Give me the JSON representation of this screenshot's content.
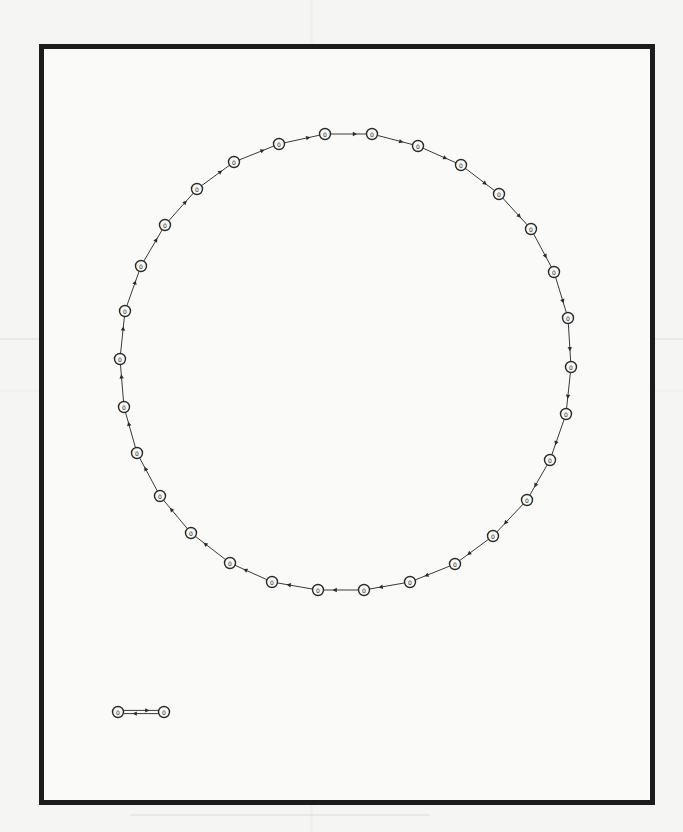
{
  "figure": {
    "type": "directed-graph",
    "frame": {
      "left": 39,
      "top": 44,
      "right": 650,
      "bottom": 800,
      "border_color": "#1c1c1c",
      "border_width": 5
    },
    "colors": {
      "edge": "#3a3a3a",
      "node_stroke": "#2a2a2a",
      "node_fill": "#f8f8f6",
      "background": "#f5f5f3"
    }
  },
  "ring": {
    "center": [
      345,
      362
    ],
    "radius": 227,
    "direction": "clockwise",
    "nodes": [
      {
        "id": "n0",
        "x": 325,
        "y": 134,
        "label": "0"
      },
      {
        "id": "n1",
        "x": 372,
        "y": 134,
        "label": "0"
      },
      {
        "id": "n2",
        "x": 418,
        "y": 146,
        "label": "0"
      },
      {
        "id": "n3",
        "x": 461,
        "y": 165,
        "label": "0"
      },
      {
        "id": "n4",
        "x": 499,
        "y": 194,
        "label": "0"
      },
      {
        "id": "n5",
        "x": 531,
        "y": 229,
        "label": "0"
      },
      {
        "id": "n6",
        "x": 554,
        "y": 272,
        "label": "0"
      },
      {
        "id": "n7",
        "x": 568,
        "y": 318,
        "label": "0"
      },
      {
        "id": "n8",
        "x": 571,
        "y": 367,
        "label": "0"
      },
      {
        "id": "n9",
        "x": 566,
        "y": 414,
        "label": "0"
      },
      {
        "id": "n10",
        "x": 550,
        "y": 460,
        "label": "0"
      },
      {
        "id": "n11",
        "x": 527,
        "y": 500,
        "label": "0"
      },
      {
        "id": "n12",
        "x": 493,
        "y": 536,
        "label": "0"
      },
      {
        "id": "n13",
        "x": 455,
        "y": 564,
        "label": "0"
      },
      {
        "id": "n14",
        "x": 410,
        "y": 582,
        "label": "0"
      },
      {
        "id": "n15",
        "x": 364,
        "y": 590,
        "label": "0"
      },
      {
        "id": "n16",
        "x": 318,
        "y": 590,
        "label": "0"
      },
      {
        "id": "n17",
        "x": 272,
        "y": 582,
        "label": "0"
      },
      {
        "id": "n18",
        "x": 230,
        "y": 563,
        "label": "0"
      },
      {
        "id": "n19",
        "x": 191,
        "y": 533,
        "label": "0"
      },
      {
        "id": "n20",
        "x": 160,
        "y": 496,
        "label": "0"
      },
      {
        "id": "n21",
        "x": 137,
        "y": 453,
        "label": "0"
      },
      {
        "id": "n22",
        "x": 124,
        "y": 407,
        "label": "0"
      },
      {
        "id": "n23",
        "x": 120,
        "y": 359,
        "label": "0"
      },
      {
        "id": "n24",
        "x": 125,
        "y": 311,
        "label": "0"
      },
      {
        "id": "n25",
        "x": 141,
        "y": 266,
        "label": "0"
      },
      {
        "id": "n26",
        "x": 165,
        "y": 225,
        "label": "0"
      },
      {
        "id": "n27",
        "x": 197,
        "y": 189,
        "label": "0"
      },
      {
        "id": "n28",
        "x": 234,
        "y": 162,
        "label": "0"
      },
      {
        "id": "n29",
        "x": 279,
        "y": 144,
        "label": "0"
      }
    ]
  },
  "pair": {
    "nodes": [
      {
        "id": "p0",
        "x": 118,
        "y": 712,
        "label": "0"
      },
      {
        "id": "p1",
        "x": 164,
        "y": 712,
        "label": "0"
      }
    ],
    "edges": "bidirectional"
  }
}
